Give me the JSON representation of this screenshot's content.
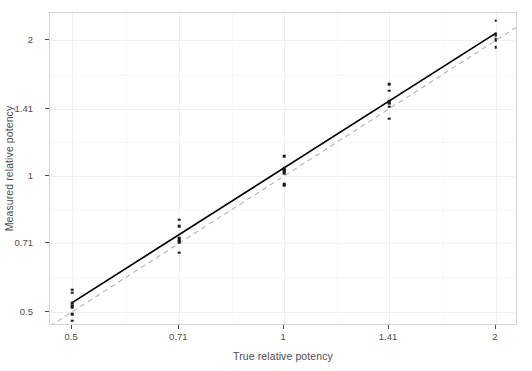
{
  "chart_data": {
    "type": "scatter",
    "title": "",
    "xlabel": "True relative potency",
    "ylabel": "Measured relative potency",
    "x_scale": "log2",
    "y_scale": "log2",
    "xticks": [
      0.5,
      0.71,
      1,
      1.41,
      2
    ],
    "xtick_labels": [
      "0.5",
      "0.71",
      "1",
      "1.41",
      "2"
    ],
    "yticks": [
      0.5,
      0.71,
      1,
      1.41,
      2
    ],
    "ytick_labels": [
      "0.5",
      "0.71",
      "1",
      "1.41",
      "2"
    ],
    "xlim": [
      0.465,
      2.15
    ],
    "ylim": [
      0.465,
      2.3
    ],
    "grid": true,
    "grid_major": true,
    "grid_minor": true,
    "legend": "none",
    "categories": [
      0.5,
      0.71,
      1,
      1.41,
      2
    ],
    "series": [
      {
        "name": "Measured relative potency",
        "marker": "square",
        "color": "#1a1a1a",
        "points": [
          {
            "x": 0.5,
            "y": 0.56
          },
          {
            "x": 0.5,
            "y": 0.551
          },
          {
            "x": 0.5,
            "y": 0.522
          },
          {
            "x": 0.5,
            "y": 0.516
          },
          {
            "x": 0.5,
            "y": 0.512
          },
          {
            "x": 0.5,
            "y": 0.494
          },
          {
            "x": 0.5,
            "y": 0.478
          },
          {
            "x": 0.71,
            "y": 0.8
          },
          {
            "x": 0.71,
            "y": 0.774
          },
          {
            "x": 0.71,
            "y": 0.73
          },
          {
            "x": 0.71,
            "y": 0.724
          },
          {
            "x": 0.71,
            "y": 0.719
          },
          {
            "x": 0.71,
            "y": 0.714
          },
          {
            "x": 0.71,
            "y": 0.676
          },
          {
            "x": 1.0,
            "y": 1.108
          },
          {
            "x": 1.0,
            "y": 1.04
          },
          {
            "x": 1.0,
            "y": 1.032
          },
          {
            "x": 1.0,
            "y": 1.024
          },
          {
            "x": 1.0,
            "y": 1.016
          },
          {
            "x": 1.0,
            "y": 0.96
          },
          {
            "x": 1.0,
            "y": 0.952
          },
          {
            "x": 1.41,
            "y": 1.6
          },
          {
            "x": 1.41,
            "y": 1.545
          },
          {
            "x": 1.41,
            "y": 1.47
          },
          {
            "x": 1.41,
            "y": 1.458
          },
          {
            "x": 1.41,
            "y": 1.446
          },
          {
            "x": 1.41,
            "y": 1.424
          },
          {
            "x": 1.41,
            "y": 1.34
          },
          {
            "x": 2.0,
            "y": 2.21
          },
          {
            "x": 2.0,
            "y": 2.07
          },
          {
            "x": 2.0,
            "y": 2.06
          },
          {
            "x": 2.0,
            "y": 2.05
          },
          {
            "x": 2.0,
            "y": 2.01
          },
          {
            "x": 2.0,
            "y": 1.995
          },
          {
            "x": 2.0,
            "y": 1.93
          }
        ]
      }
    ],
    "annotations": [
      {
        "name": "fitted-regression-line",
        "type": "line",
        "style": "solid",
        "color": "#000000",
        "width": 1.6,
        "x": [
          0.5,
          2.0
        ],
        "y": [
          0.524,
          2.075
        ]
      },
      {
        "name": "identity-reference-line",
        "type": "line",
        "style": "dashed",
        "color": "#b8b8b8",
        "width": 1.2,
        "x": [
          0.465,
          2.15
        ],
        "y": [
          0.465,
          2.15
        ]
      }
    ],
    "colors": {
      "point": "#1a1a1a",
      "fit_line": "#000000",
      "reference_line": "#b8b8b8",
      "panel_background": "#ffffff",
      "panel_border": "#d6d6d6",
      "grid_major": "#f0f0f0",
      "grid_minor": "#f7f7f7",
      "text": "#4d4d4d"
    }
  }
}
